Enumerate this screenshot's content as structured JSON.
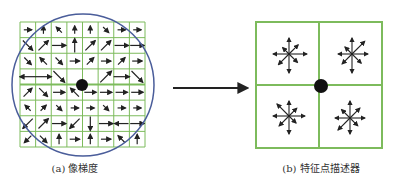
{
  "figure": {
    "panel_a": {
      "caption": "(a) 像梯度",
      "grid": {
        "x": 20,
        "y": 22,
        "size": 125,
        "cells": 8
      },
      "circle": {
        "cx": 83,
        "cy": 85,
        "r": 71
      },
      "keypoint": {
        "cx": 82,
        "cy": 85,
        "r": 6
      },
      "gradients": [
        [
          [
            0,
            0,
            0
          ],
          [
            0,
            1,
            -90
          ],
          [
            0,
            2,
            -135
          ],
          [
            0,
            3,
            -90
          ],
          [
            0,
            4,
            -90
          ],
          [
            0,
            5,
            45
          ],
          [
            0,
            6,
            0
          ],
          [
            0,
            7,
            0
          ]
        ],
        [
          [
            1,
            0,
            45
          ],
          [
            1,
            1,
            -45
          ],
          [
            1,
            2,
            0
          ],
          [
            1,
            3,
            -90
          ],
          [
            1,
            4,
            -45
          ],
          [
            1,
            5,
            -45
          ],
          [
            1,
            6,
            0
          ],
          [
            1,
            7,
            0
          ]
        ],
        [
          [
            2,
            0,
            45
          ],
          [
            2,
            1,
            -135
          ],
          [
            2,
            2,
            45
          ],
          [
            2,
            3,
            0
          ],
          [
            2,
            4,
            -45
          ],
          [
            2,
            5,
            0
          ],
          [
            2,
            6,
            -45
          ],
          [
            2,
            7,
            0
          ]
        ],
        [
          [
            3,
            0,
            180
          ],
          [
            3,
            1,
            0
          ],
          [
            3,
            2,
            45
          ],
          [
            3,
            3,
            0
          ],
          [
            3,
            4,
            0
          ],
          [
            3,
            5,
            -45
          ],
          [
            3,
            6,
            0
          ],
          [
            3,
            7,
            45
          ]
        ],
        [
          [
            4,
            0,
            -45
          ],
          [
            4,
            1,
            45
          ],
          [
            4,
            2,
            0
          ],
          [
            4,
            3,
            -135
          ],
          [
            4,
            4,
            0
          ],
          [
            4,
            5,
            0
          ],
          [
            4,
            6,
            0
          ],
          [
            4,
            7,
            0
          ]
        ],
        [
          [
            5,
            0,
            -135
          ],
          [
            5,
            1,
            -45
          ],
          [
            5,
            2,
            45
          ],
          [
            5,
            3,
            0
          ],
          [
            5,
            4,
            0
          ],
          [
            5,
            5,
            45
          ],
          [
            5,
            6,
            0
          ],
          [
            5,
            7,
            0
          ]
        ],
        [
          [
            6,
            0,
            135
          ],
          [
            6,
            1,
            -45
          ],
          [
            6,
            2,
            0
          ],
          [
            6,
            3,
            135
          ],
          [
            6,
            4,
            90
          ],
          [
            6,
            5,
            0
          ],
          [
            6,
            6,
            180
          ],
          [
            6,
            7,
            0
          ]
        ],
        [
          [
            7,
            0,
            135
          ],
          [
            7,
            1,
            45
          ],
          [
            7,
            2,
            -90
          ],
          [
            7,
            3,
            0
          ],
          [
            7,
            4,
            -90
          ],
          [
            7,
            5,
            0
          ],
          [
            7,
            6,
            -135
          ],
          [
            7,
            7,
            -90
          ]
        ]
      ]
    },
    "transform_arrow": {
      "x1": 173,
      "y1": 88,
      "x2": 247,
      "y2": 88
    },
    "panel_b": {
      "caption": "(b) 特征点描述器",
      "grid": {
        "x": 256,
        "y": 22,
        "size": 126
      },
      "keypoint": {
        "cx": 321,
        "cy": 86,
        "r": 7
      },
      "histograms": [
        {
          "cx": 289,
          "cy": 54,
          "lengths": [
            18,
            13,
            16,
            9,
            16,
            15,
            19,
            12
          ]
        },
        {
          "cx": 352,
          "cy": 54,
          "lengths": [
            16,
            18,
            16,
            10,
            14,
            14,
            19,
            13
          ]
        },
        {
          "cx": 289,
          "cy": 116,
          "lengths": [
            16,
            11,
            15,
            17,
            16,
            14,
            18,
            10
          ]
        },
        {
          "cx": 350,
          "cy": 118,
          "lengths": [
            15,
            14,
            17,
            12,
            15,
            17,
            16,
            11
          ]
        }
      ]
    },
    "colors": {
      "grid": "#7dbb5c",
      "circle": "#4a5d9a",
      "arrow": "#222222",
      "keypoint": "#111111"
    }
  }
}
